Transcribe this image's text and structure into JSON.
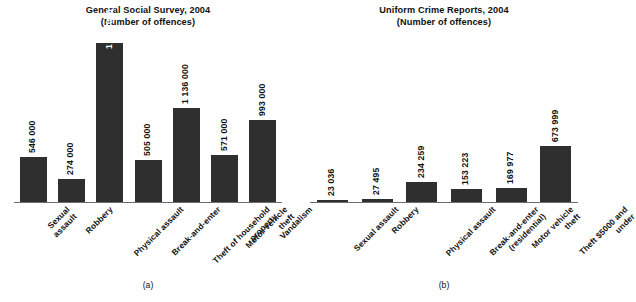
{
  "figure": {
    "background_color": "#ffffff",
    "bar_color": "#2f2f2f",
    "axis_color": "#6d6d6d"
  },
  "panels": [
    {
      "caption": "(a)",
      "title_line1": "General Social Survey, 2004",
      "title_line2": "(Number of offences)"
    },
    {
      "caption": "(b)",
      "title_line1": "Uniform Crime Reports, 2004",
      "title_line2": "(Number of offences)"
    }
  ],
  "chart_data": [
    {
      "type": "bar",
      "title": "General Social Survey, 2004",
      "subtitle": "(Number of offences)",
      "caption": "(a)",
      "xlabel": "",
      "ylabel": "Number of offences",
      "ylim": [
        0,
        2100000
      ],
      "grid": false,
      "legend": "none",
      "axis_ticks": [],
      "categories": [
        "Sexual assault",
        "Robbery",
        "Physical assault",
        "Break-and-enter",
        "Theft of household property",
        "Motor vehicle theft",
        "Vandalism"
      ],
      "category_lines": [
        [
          "Sexual",
          "assault"
        ],
        [
          "Robbery"
        ],
        [
          "Physical assault"
        ],
        [
          "Break-and-enter"
        ],
        [
          "Theft of household",
          "property"
        ],
        [
          "Motor vehicle",
          "theft"
        ],
        [
          "Vandalism"
        ]
      ],
      "values": [
        546000,
        274000,
        1931000,
        505000,
        1136000,
        571000,
        993000
      ],
      "data_labels": [
        "546 000",
        "274 000",
        "1 931 000",
        "505 000",
        "1 136 000",
        "571 000",
        "993 000"
      ],
      "label_placement": [
        "outside",
        "outside",
        "inside",
        "outside",
        "outside",
        "outside",
        "outside"
      ]
    },
    {
      "type": "bar",
      "title": "Uniform Crime Reports, 2004",
      "subtitle": "(Number of offences)",
      "caption": "(b)",
      "xlabel": "",
      "ylabel": "Number of offences",
      "ylim": [
        0,
        2100000
      ],
      "grid": false,
      "legend": "none",
      "axis_ticks": [],
      "categories": [
        "Sexual assault",
        "Robbery",
        "Physical assault",
        "Break-and-enter (residential)",
        "Motor vehicle theft",
        "Theft $5000 and under"
      ],
      "category_lines": [
        [
          "Sexual assault"
        ],
        [
          "Robbery"
        ],
        [
          "Physical assault"
        ],
        [
          "Break-and-enter",
          "(residential)"
        ],
        [
          "Motor vehicle",
          "theft"
        ],
        [
          "Theft $5000 and",
          "under"
        ]
      ],
      "values": [
        23036,
        27495,
        234259,
        153223,
        169977,
        673999
      ],
      "data_labels": [
        "23 036",
        "27 495",
        "234 259",
        "153 223",
        "169 977",
        "673 999"
      ],
      "label_placement": [
        "outside",
        "outside",
        "outside",
        "outside",
        "outside",
        "outside"
      ]
    }
  ]
}
